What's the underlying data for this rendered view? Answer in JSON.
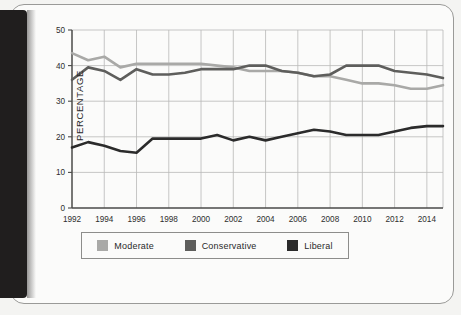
{
  "page": {
    "background_color": "#f4f4f2",
    "border_color": "#9a9a98",
    "gutter_color": "#201e1e"
  },
  "chart_data": {
    "type": "line",
    "title": "",
    "subtitle": "",
    "xlabel": "",
    "ylabel": "PERCENTAGE",
    "ylim": [
      0,
      50
    ],
    "xlim": [
      1992,
      2015
    ],
    "grid": true,
    "y_ticks": [
      "0",
      "10",
      "20",
      "30",
      "40",
      "50"
    ],
    "y_tick_values": [
      0,
      10,
      20,
      30,
      40,
      50
    ],
    "x_ticks": [
      "1992",
      "1994",
      "1996",
      "1998",
      "2000",
      "2002",
      "2004",
      "2006",
      "2008",
      "2010",
      "2012",
      "2014"
    ],
    "x_tick_values": [
      1992,
      1994,
      1996,
      1998,
      2000,
      2002,
      2004,
      2006,
      2008,
      2010,
      2012,
      2014
    ],
    "x": [
      1992,
      1993,
      1994,
      1995,
      1996,
      1997,
      1998,
      1999,
      2000,
      2001,
      2002,
      2003,
      2004,
      2005,
      2006,
      2007,
      2008,
      2009,
      2010,
      2011,
      2012,
      2013,
      2014,
      2015
    ],
    "legend_position": "bottom",
    "series": [
      {
        "name": "Moderate",
        "color": "#a9a9a7",
        "values": [
          43.5,
          41.5,
          42.5,
          39.5,
          40.5,
          40.5,
          40.5,
          40.5,
          40.5,
          40.0,
          39.5,
          38.5,
          38.5,
          38.5,
          38.0,
          37.0,
          37.0,
          36.0,
          35.0,
          35.0,
          34.5,
          33.5,
          33.5,
          34.5
        ]
      },
      {
        "name": "Conservative",
        "color": "#5e5e5c",
        "values": [
          36.0,
          39.5,
          38.5,
          36.0,
          39.0,
          37.5,
          37.5,
          38.0,
          39.0,
          39.0,
          39.0,
          40.0,
          40.0,
          38.5,
          38.0,
          37.0,
          37.5,
          40.0,
          40.0,
          40.0,
          38.5,
          38.0,
          37.5,
          36.5
        ]
      },
      {
        "name": "Liberal",
        "color": "#2b2b2b",
        "values": [
          17.0,
          18.5,
          17.5,
          16.0,
          15.5,
          19.5,
          19.5,
          19.5,
          19.5,
          20.5,
          19.0,
          20.0,
          19.0,
          20.0,
          21.0,
          22.0,
          21.5,
          20.5,
          20.5,
          20.5,
          21.5,
          22.5,
          23.0,
          23.0
        ]
      }
    ]
  },
  "legend": {
    "items": [
      {
        "label": "Moderate",
        "color": "#a9a9a7"
      },
      {
        "label": "Conservative",
        "color": "#5e5e5c"
      },
      {
        "label": "Liberal",
        "color": "#2b2b2b"
      }
    ]
  }
}
